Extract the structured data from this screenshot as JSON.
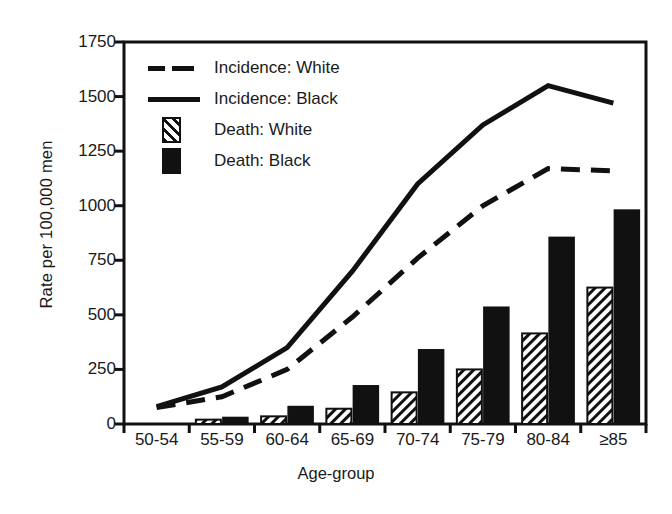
{
  "chart_data": {
    "type": "bar",
    "title": "",
    "xlabel": "Age-group",
    "ylabel": "Rate per 100,000 men",
    "categories": [
      "50-54",
      "55-59",
      "60-64",
      "65-69",
      "70-74",
      "75-79",
      "80-84",
      "≥85"
    ],
    "ylim": [
      0,
      1750
    ],
    "yticks": [
      0,
      250,
      500,
      750,
      1000,
      1250,
      1500,
      1750
    ],
    "ytick_labels": [
      "0",
      "250",
      "500",
      "750",
      "1000",
      "1250",
      "1500",
      "1750"
    ],
    "grid": false,
    "legend_position": "top-left",
    "series": [
      {
        "name": "Incidence: White",
        "render": "line",
        "style": "dashed",
        "color": "#111111",
        "values": [
          75,
          125,
          250,
          490,
          760,
          1000,
          1170,
          1160
        ]
      },
      {
        "name": "Incidence: Black",
        "render": "line",
        "style": "solid",
        "color": "#111111",
        "values": [
          80,
          170,
          350,
          700,
          1100,
          1370,
          1550,
          1470
        ]
      },
      {
        "name": "Death: White",
        "render": "bar",
        "style": "hatched",
        "color": "#111111",
        "values": [
          0,
          20,
          35,
          70,
          145,
          250,
          415,
          625
        ]
      },
      {
        "name": "Death: Black",
        "render": "bar",
        "style": "filled",
        "color": "#111111",
        "values": [
          0,
          30,
          80,
          175,
          340,
          535,
          855,
          980
        ]
      }
    ]
  },
  "legend": {
    "items": [
      {
        "label": "Incidence: White",
        "marker": "dashed-line"
      },
      {
        "label": "Incidence: Black",
        "marker": "solid-line"
      },
      {
        "label": "Death: White",
        "marker": "hatched-box"
      },
      {
        "label": "Death: Black",
        "marker": "filled-box"
      }
    ]
  },
  "axes": {
    "y_title": "Rate per 100,000 men",
    "x_title": "Age-group"
  },
  "colors": {
    "ink": "#111111",
    "background": "#ffffff"
  }
}
